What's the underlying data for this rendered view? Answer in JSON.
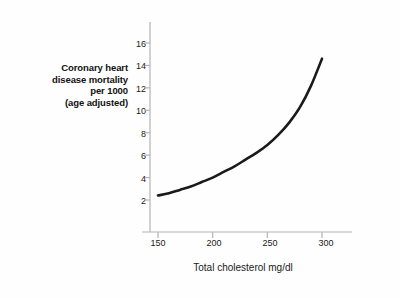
{
  "chart_data": {
    "type": "line",
    "title": "",
    "xlabel": "Total cholesterol mg/dl",
    "ylabel": "Coronary heart disease mortality per 1000 (age adjusted)",
    "ylabel_lines": [
      "Coronary heart",
      "disease mortality",
      "per 1000",
      "(age adjusted)"
    ],
    "xlim": [
      140,
      312
    ],
    "ylim": [
      0,
      17
    ],
    "xticks": [
      150,
      200,
      250,
      300
    ],
    "xtick_labels": [
      "150",
      "200",
      "250",
      "300"
    ],
    "yticks": [
      2,
      4,
      6,
      8,
      10,
      12,
      14,
      16
    ],
    "ytick_labels": [
      "2",
      "4",
      "6",
      "8",
      "10",
      "12",
      "14",
      "16"
    ],
    "grid": false,
    "legend": null,
    "series": [
      {
        "name": "CHD mortality per 1000",
        "color": "#1a1a1a",
        "line_width": 2.6,
        "x": [
          150,
          160,
          170,
          180,
          190,
          200,
          210,
          220,
          230,
          240,
          250,
          260,
          270,
          280,
          290,
          300
        ],
        "y": [
          2.4,
          2.6,
          2.9,
          3.2,
          3.6,
          4.0,
          4.5,
          5.0,
          5.6,
          6.2,
          6.9,
          7.8,
          8.9,
          10.3,
          12.2,
          14.6
        ]
      }
    ],
    "axis_color": "#b4b4b4",
    "text_color": "#1a1a1a",
    "background": "#fefefe"
  }
}
